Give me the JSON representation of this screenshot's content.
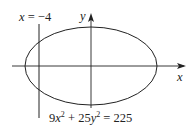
{
  "diagram": {
    "type": "ellipse-with-vertical-line",
    "line_label": {
      "var": "x",
      "eq": " = −4"
    },
    "y_axis_label": "y",
    "x_axis_label": "x",
    "equation": {
      "t1_coef": "9",
      "t1_var": "x",
      "t1_exp": "2",
      "plus": " + ",
      "t2_coef": "25",
      "t2_var": "y",
      "t2_exp": "2",
      "rhs": " = 225"
    },
    "colors": {
      "stroke": "#222222",
      "background": "#ffffff"
    }
  }
}
